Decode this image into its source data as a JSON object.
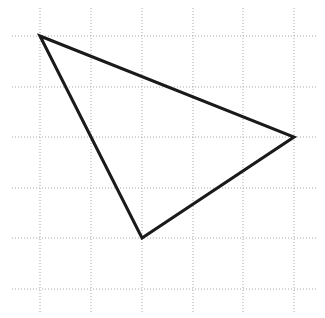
{
  "canvas": {
    "width": 325,
    "height": 318,
    "background_color": "#ffffff"
  },
  "grid": {
    "name": "dotted-coordinate-grid",
    "line_color": "#a8a8a8",
    "line_width": 1,
    "dash_pattern": "1 2",
    "spacing_x": 50.7,
    "spacing_y": 50.6,
    "vertical_lines_x": [
      40,
      91,
      142,
      193,
      243,
      294
    ],
    "horizontal_lines_y": [
      36,
      87,
      137,
      188,
      238,
      289
    ],
    "vertical_extent_y": [
      8,
      312
    ],
    "horizontal_extent_x": [
      12,
      318
    ]
  },
  "chart_data": {
    "type": "scatter",
    "title": "",
    "xlabel": "",
    "ylabel": "",
    "grid": true,
    "legend_position": "none",
    "xlim": [
      40,
      294
    ],
    "ylim": [
      36,
      289
    ],
    "shapes": [
      {
        "name": "triangle",
        "type": "polygon",
        "closed": true,
        "stroke_color": "#1a1a1a",
        "stroke_width": 3,
        "fill": "none",
        "points_px": [
          [
            40,
            36
          ],
          [
            294,
            137
          ],
          [
            142,
            238
          ]
        ],
        "points_grid": [
          [
            0,
            0
          ],
          [
            5,
            2
          ],
          [
            2,
            4
          ]
        ],
        "vertex_labels": [
          "top-left-vertex",
          "right-vertex",
          "bottom-vertex"
        ],
        "path": "M 40 36 L 294 137 L 142 238 Z"
      }
    ]
  }
}
